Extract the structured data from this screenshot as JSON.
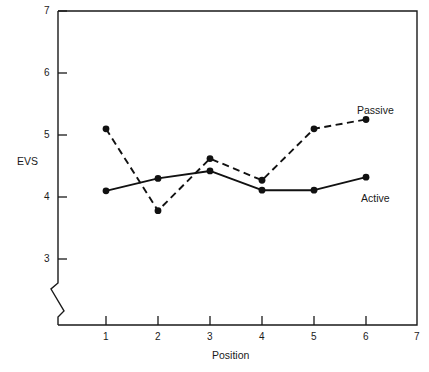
{
  "chart_data": {
    "type": "line",
    "title": "",
    "xlabel": "Position",
    "ylabel": "EVS",
    "x": [
      1,
      2,
      3,
      4,
      5,
      6
    ],
    "xlim": [
      0,
      7
    ],
    "ylim": [
      2.6,
      7
    ],
    "y_axis_break": true,
    "grid": false,
    "legend_position": "inline-right",
    "xticks": [
      "1",
      "2",
      "3",
      "4",
      "5",
      "6",
      "7"
    ],
    "xtick_values": [
      1,
      2,
      3,
      4,
      5,
      6,
      7
    ],
    "yticks": [
      "3",
      "4",
      "5",
      "6",
      "7"
    ],
    "ytick_values": [
      3,
      4,
      5,
      6,
      7
    ],
    "series": [
      {
        "name": "Passive",
        "style": "dashed",
        "marker": "filled-circle",
        "values": [
          5.1,
          3.78,
          4.62,
          4.27,
          5.1,
          5.25
        ]
      },
      {
        "name": "Active",
        "style": "solid",
        "marker": "filled-circle",
        "values": [
          4.1,
          4.3,
          4.42,
          4.11,
          4.11,
          4.32
        ]
      }
    ],
    "colors": {
      "line": "#111111",
      "marker": "#111111",
      "axis": "#1a1a1a",
      "background": "#ffffff"
    }
  },
  "annotations": {
    "passive_label": "Passive",
    "active_label": "Active"
  }
}
